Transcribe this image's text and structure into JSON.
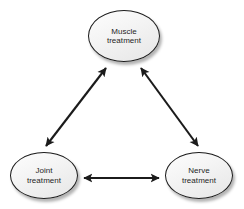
{
  "diagram": {
    "type": "triangular-cycle",
    "background_color": "#ffffff",
    "node_fill_color": "#f2f2f2",
    "node_border_color": "#1b1b1b",
    "edge_color": "#1b1b1b",
    "text_color": "#1f1f1f",
    "nodes": [
      {
        "id": "muscle",
        "label": "Muscle\ntreatment",
        "line1": "Muscle",
        "line2": "treatment",
        "position": "top-center"
      },
      {
        "id": "joint",
        "label": "Joint\ntreatment",
        "line1": "Joint",
        "line2": "treatment",
        "position": "bottom-left"
      },
      {
        "id": "nerve",
        "label": "Nerve\ntreatment",
        "line1": "Nerve",
        "line2": "treatment",
        "position": "bottom-right"
      }
    ],
    "edges": [
      {
        "id": "joint-muscle",
        "from": "joint",
        "to": "muscle",
        "direction": "bidirectional",
        "orientation": "diagonal-left"
      },
      {
        "id": "muscle-nerve",
        "from": "muscle",
        "to": "nerve",
        "direction": "bidirectional",
        "orientation": "diagonal-right"
      },
      {
        "id": "joint-nerve",
        "from": "joint",
        "to": "nerve",
        "direction": "bidirectional",
        "orientation": "horizontal"
      }
    ]
  }
}
